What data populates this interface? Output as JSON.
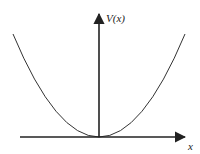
{
  "diagram": {
    "type": "potential-well-plot",
    "curve": "parabola",
    "y_axis_label": "V(x)",
    "x_axis_label": "x",
    "colors": {
      "stroke": "#222222",
      "background": "#ffffff"
    }
  }
}
